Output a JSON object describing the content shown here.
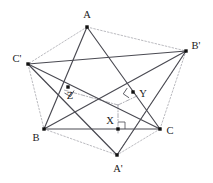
{
  "figure": {
    "width": 213,
    "height": 183,
    "background": "#ffffff",
    "solid_color": "#4a4a52",
    "dotted_color": "#a8a8ae",
    "dashdot_color": "#9a9aa2",
    "point_color": "#111111",
    "label_color": "#1a1a1a"
  },
  "points": [
    {
      "id": "A",
      "label": "A",
      "x": 87,
      "y": 27,
      "label_x": 87,
      "label_y": 18,
      "anchor": "middle"
    },
    {
      "id": "B",
      "label": "B",
      "x": 44,
      "y": 129,
      "label_x": 36,
      "label_y": 141,
      "anchor": "middle"
    },
    {
      "id": "C",
      "label": "C",
      "x": 160,
      "y": 129,
      "label_x": 170,
      "label_y": 134,
      "anchor": "middle"
    },
    {
      "id": "Ap",
      "label": "A'",
      "x": 117,
      "y": 155,
      "label_x": 118,
      "label_y": 172,
      "anchor": "middle"
    },
    {
      "id": "Bp",
      "label": "B'",
      "x": 186,
      "y": 51,
      "label_x": 196,
      "label_y": 49,
      "anchor": "middle"
    },
    {
      "id": "Cp",
      "label": "C'",
      "x": 28,
      "y": 64,
      "label_x": 17,
      "label_y": 62,
      "anchor": "middle"
    },
    {
      "id": "X",
      "label": "X",
      "x": 118,
      "y": 129,
      "label_x": 110,
      "label_y": 124,
      "anchor": "middle"
    },
    {
      "id": "Y",
      "label": "Y",
      "x": 133,
      "y": 92,
      "label_x": 143,
      "label_y": 97,
      "anchor": "middle"
    },
    {
      "id": "Z",
      "label": "Z",
      "x": 68,
      "y": 87,
      "label_x": 70,
      "label_y": 99,
      "anchor": "middle"
    }
  ],
  "solid_edges": [
    {
      "name": "edge-B-C",
      "from": "B",
      "to": "C"
    },
    {
      "name": "edge-Cp-Bp",
      "from": "Cp",
      "to": "Bp"
    },
    {
      "name": "edge-A-B",
      "from": "A",
      "to": "B"
    },
    {
      "name": "edge-A-C",
      "from": "A",
      "to": "C"
    },
    {
      "name": "edge-Ap-Bp",
      "from": "Ap",
      "to": "Bp"
    },
    {
      "name": "edge-Ap-Cp",
      "from": "Ap",
      "to": "Cp"
    },
    {
      "name": "edge-Bp-B",
      "from": "Bp",
      "to": "B"
    },
    {
      "name": "edge-Cp-C",
      "from": "Cp",
      "to": "C"
    }
  ],
  "dotted_edges": [
    {
      "name": "dotted-A-Cp",
      "from": "A",
      "to": "Cp"
    },
    {
      "name": "dotted-A-Bp",
      "from": "A",
      "to": "Bp"
    },
    {
      "name": "dotted-Cp-B",
      "from": "Cp",
      "to": "B"
    },
    {
      "name": "dotted-Bp-C",
      "from": "Bp",
      "to": "C"
    },
    {
      "name": "dotted-B-Ap",
      "from": "B",
      "to": "Ap"
    },
    {
      "name": "dotted-C-Ap",
      "from": "C",
      "to": "Ap"
    },
    {
      "name": "dotted-Cp-Ap",
      "from": "Cp",
      "to": "Ap"
    },
    {
      "name": "dotted-Bp-Ap",
      "from": "Bp",
      "to": "Ap"
    }
  ],
  "center": {
    "x": 118,
    "y": 105
  },
  "dashdot_rays": [
    {
      "name": "ray-center-X",
      "from_xy": [
        118,
        105
      ],
      "to_xy": [
        118,
        133
      ]
    },
    {
      "name": "ray-center-Y",
      "from_xy": [
        118,
        105
      ],
      "to_xy": [
        137,
        96
      ]
    },
    {
      "name": "ray-center-Z",
      "from_xy": [
        118,
        105
      ],
      "to_xy": [
        64,
        90
      ]
    }
  ],
  "right_angle_marks": [
    {
      "name": "right-angle-at-X",
      "x": 118,
      "y": 129,
      "size": 7,
      "rotation": 0
    },
    {
      "name": "right-angle-at-Y",
      "x": 133,
      "y": 92,
      "size": 7,
      "rotation": 214
    },
    {
      "name": "right-angle-at-Z",
      "x": 68,
      "y": 87,
      "size": 7,
      "rotation": 120
    }
  ]
}
